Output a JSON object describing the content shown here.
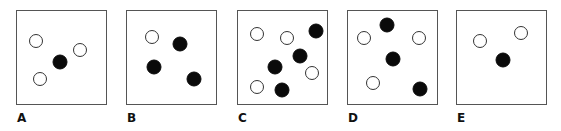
{
  "figure": {
    "colors": {
      "border": "#555555",
      "filled": "#0a0a0a",
      "hollow_stroke": "#333333",
      "background": "#ffffff"
    },
    "panels": [
      {
        "label": "A",
        "box": [
          16,
          10,
          91,
          95
        ],
        "dots": [
          {
            "type": "hollow",
            "x": 36,
            "y": 41
          },
          {
            "type": "hollow",
            "x": 80,
            "y": 50
          },
          {
            "type": "hollow",
            "x": 40,
            "y": 79
          },
          {
            "type": "filled",
            "x": 60,
            "y": 62
          }
        ]
      },
      {
        "label": "B",
        "box": [
          126,
          10,
          91,
          95
        ],
        "dots": [
          {
            "type": "hollow",
            "x": 152,
            "y": 37
          },
          {
            "type": "filled",
            "x": 180,
            "y": 44
          },
          {
            "type": "filled",
            "x": 154,
            "y": 67
          },
          {
            "type": "filled",
            "x": 194,
            "y": 79
          }
        ]
      },
      {
        "label": "C",
        "box": [
          237,
          10,
          91,
          95
        ],
        "dots": [
          {
            "type": "hollow",
            "x": 257,
            "y": 34
          },
          {
            "type": "hollow",
            "x": 287,
            "y": 38
          },
          {
            "type": "filled",
            "x": 316,
            "y": 31
          },
          {
            "type": "filled",
            "x": 300,
            "y": 56
          },
          {
            "type": "filled",
            "x": 275,
            "y": 67
          },
          {
            "type": "hollow",
            "x": 312,
            "y": 73
          },
          {
            "type": "hollow",
            "x": 257,
            "y": 87
          },
          {
            "type": "filled",
            "x": 282,
            "y": 90
          }
        ]
      },
      {
        "label": "D",
        "box": [
          347,
          10,
          91,
          95
        ],
        "dots": [
          {
            "type": "filled",
            "x": 387,
            "y": 25
          },
          {
            "type": "hollow",
            "x": 364,
            "y": 38
          },
          {
            "type": "hollow",
            "x": 419,
            "y": 38
          },
          {
            "type": "filled",
            "x": 393,
            "y": 59
          },
          {
            "type": "hollow",
            "x": 373,
            "y": 83
          },
          {
            "type": "filled",
            "x": 420,
            "y": 89
          }
        ]
      },
      {
        "label": "E",
        "box": [
          456,
          10,
          91,
          95
        ],
        "dots": [
          {
            "type": "hollow",
            "x": 480,
            "y": 41
          },
          {
            "type": "hollow",
            "x": 521,
            "y": 33
          },
          {
            "type": "filled",
            "x": 503,
            "y": 60
          }
        ]
      }
    ]
  }
}
